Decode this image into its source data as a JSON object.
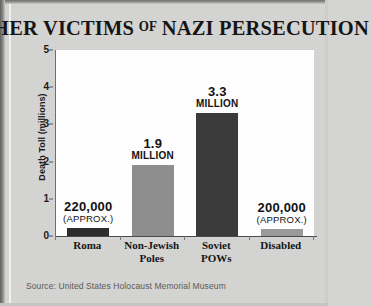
{
  "title": {
    "part1": "OTHER VICTIMS",
    "of": "OF",
    "part2": "NAZI PERSECUTION",
    "full": "OTHER VICTIMS OF NAZI PERSECUTION"
  },
  "source": {
    "text": "Source: United States Holocaust Memorial Museum"
  },
  "colors": {
    "background": "#d4d4d2",
    "plot_background": "#ffffff",
    "bar_dark": "#2b2b2b",
    "bar_gray": "#8e8e8e",
    "text": "#141414",
    "axis": "#4a4a4a"
  },
  "chart_data": {
    "type": "bar",
    "xlabel": "",
    "ylabel": "Death Toll (millions)",
    "ylim": [
      0,
      5
    ],
    "yticks": [
      "0",
      "1",
      "2",
      "3",
      "4",
      "5"
    ],
    "grid": false,
    "legend": "none",
    "categories": [
      "Roma",
      "Non-Jewish Poles",
      "Soviet POWs",
      "Disabled"
    ],
    "values": [
      0.22,
      1.9,
      3.3,
      0.2
    ],
    "bars": [
      {
        "category_line1": "Roma",
        "category_line2": "",
        "value": 0.22,
        "label_big": "220,000",
        "label_sub": "(APPROX.)",
        "label_style": "approx",
        "color": "#2b2b2b"
      },
      {
        "category_line1": "Non-Jewish",
        "category_line2": "Poles",
        "value": 1.9,
        "label_big": "1.9",
        "label_sub": "MILLION",
        "label_style": "million",
        "color": "#8e8e8e"
      },
      {
        "category_line1": "Soviet",
        "category_line2": "POWs",
        "value": 3.3,
        "label_big": "3.3",
        "label_sub": "MILLION",
        "label_style": "million",
        "color": "#3a3a3a"
      },
      {
        "category_line1": "Disabled",
        "category_line2": "",
        "value": 0.2,
        "label_big": "200,000",
        "label_sub": "(APPROX.)",
        "label_style": "approx",
        "color": "#9a9a9a"
      }
    ]
  }
}
